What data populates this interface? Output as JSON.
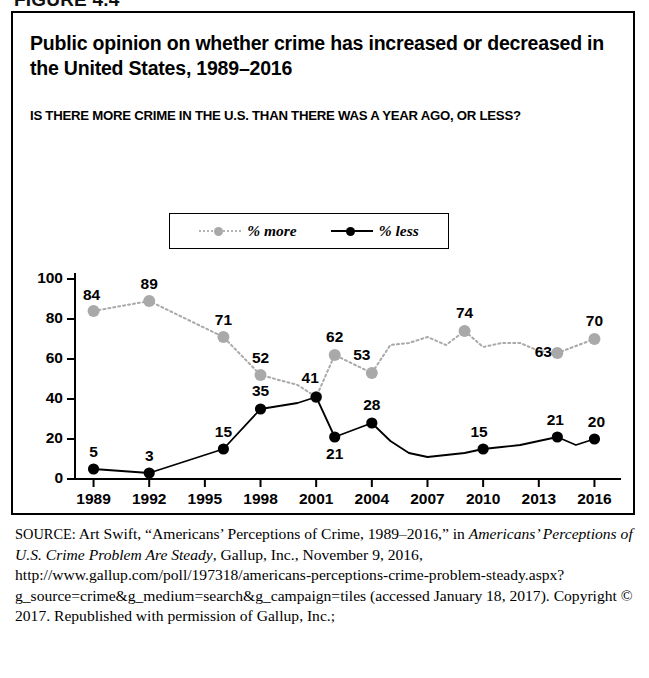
{
  "figure_label": "FIGURE 4.4",
  "chart": {
    "title": "Public opinion on whether crime has increased or decreased in the United States, 1989–2016",
    "subtitle": "IS THERE MORE CRIME IN THE U.S. THAN THERE WAS A YEAR AGO, OR LESS?",
    "legend": [
      {
        "label": "% more",
        "color": "#a9a9a9",
        "style": "dotted",
        "marker": "circle"
      },
      {
        "label": "% less",
        "color": "#000000",
        "style": "solid",
        "marker": "circle"
      }
    ]
  },
  "chart_data": {
    "type": "line",
    "title": "Public opinion on whether crime has increased or decreased in the United States, 1989–2016",
    "subtitle": "IS THERE MORE CRIME IN THE U.S. THAN THERE WAS A YEAR AGO, OR LESS?",
    "xlabel": "",
    "ylabel": "",
    "xlim": [
      1988,
      2017
    ],
    "ylim": [
      0,
      100
    ],
    "yticks": [
      0,
      20,
      40,
      60,
      80,
      100
    ],
    "xticks": [
      1989,
      1992,
      1995,
      1998,
      2001,
      2004,
      2007,
      2010,
      2013,
      2016
    ],
    "grid": false,
    "legend_position": "top-center",
    "series": [
      {
        "name": "% more",
        "color": "#a9a9a9",
        "linestyle": "dotted",
        "points": [
          {
            "x": 1989,
            "y": 84,
            "label": "84"
          },
          {
            "x": 1992,
            "y": 89,
            "label": "89"
          },
          {
            "x": 1996,
            "y": 71,
            "label": "71"
          },
          {
            "x": 1998,
            "y": 52,
            "label": "52"
          },
          {
            "x": 2000,
            "y": 47,
            "label": ""
          },
          {
            "x": 2001,
            "y": 41,
            "label": "41"
          },
          {
            "x": 2002,
            "y": 62,
            "label": "62"
          },
          {
            "x": 2004,
            "y": 53,
            "label": "53"
          },
          {
            "x": 2005,
            "y": 67,
            "label": ""
          },
          {
            "x": 2006,
            "y": 68,
            "label": ""
          },
          {
            "x": 2007,
            "y": 71,
            "label": ""
          },
          {
            "x": 2008,
            "y": 67,
            "label": ""
          },
          {
            "x": 2009,
            "y": 74,
            "label": "74"
          },
          {
            "x": 2010,
            "y": 66,
            "label": ""
          },
          {
            "x": 2011,
            "y": 68,
            "label": ""
          },
          {
            "x": 2012,
            "y": 68,
            "label": ""
          },
          {
            "x": 2013,
            "y": 64,
            "label": ""
          },
          {
            "x": 2014,
            "y": 63,
            "label": "63"
          },
          {
            "x": 2016,
            "y": 70,
            "label": "70"
          }
        ]
      },
      {
        "name": "% less",
        "color": "#000000",
        "linestyle": "solid",
        "points": [
          {
            "x": 1989,
            "y": 5,
            "label": "5"
          },
          {
            "x": 1992,
            "y": 3,
            "label": "3"
          },
          {
            "x": 1996,
            "y": 15,
            "label": "15"
          },
          {
            "x": 1998,
            "y": 35,
            "label": "35"
          },
          {
            "x": 2000,
            "y": 38,
            "label": ""
          },
          {
            "x": 2001,
            "y": 41,
            "label": "41"
          },
          {
            "x": 2002,
            "y": 21,
            "label": "21"
          },
          {
            "x": 2004,
            "y": 28,
            "label": "28"
          },
          {
            "x": 2005,
            "y": 19,
            "label": ""
          },
          {
            "x": 2006,
            "y": 13,
            "label": ""
          },
          {
            "x": 2007,
            "y": 11,
            "label": ""
          },
          {
            "x": 2008,
            "y": 12,
            "label": ""
          },
          {
            "x": 2009,
            "y": 13,
            "label": ""
          },
          {
            "x": 2010,
            "y": 15,
            "label": "15"
          },
          {
            "x": 2011,
            "y": 16,
            "label": ""
          },
          {
            "x": 2012,
            "y": 17,
            "label": ""
          },
          {
            "x": 2013,
            "y": 19,
            "label": ""
          },
          {
            "x": 2014,
            "y": 21,
            "label": "21"
          },
          {
            "x": 2015,
            "y": 17,
            "label": ""
          },
          {
            "x": 2016,
            "y": 20,
            "label": "20"
          }
        ]
      }
    ]
  },
  "source": {
    "prefix": "SOURCE:",
    "line1": " Art Swift, “Americans’ Perceptions of Crime, 1989–2016,” in ",
    "italic_title": "Americans’ Perceptions of U.S. Crime Problem Are Steady",
    "line2": ", Gallup, Inc., November 9, 2016, http://www.gallup.com/poll/197318/americans-perceptions-crime-problem-steady.aspx?g_source=crime&g_medium=search&g_campaign=tiles (accessed January 18, 2017). Copyright © 2017. Republished with permission of Gallup, Inc.;"
  }
}
